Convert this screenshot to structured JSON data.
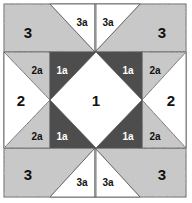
{
  "diagram": {
    "type": "quilt-block-piecing-diagram",
    "colors": {
      "background": "#ffffff",
      "print_fabric": "#c9c9c9",
      "dark_fabric": "#4d4d4d",
      "light_fabric": "#ffffff",
      "seam_line": "#555555"
    },
    "labels": {
      "center": "1",
      "dark_corner": "1a",
      "side": "2",
      "side_triangle": "2a",
      "corner": "3",
      "corner_triangle": "3a"
    },
    "pieces": {
      "center_square": {
        "label": "1",
        "fabric": "light"
      },
      "dark_triangles": [
        {
          "position": "top-left",
          "label": "1a"
        },
        {
          "position": "top-right",
          "label": "1a"
        },
        {
          "position": "bottom-left",
          "label": "1a"
        },
        {
          "position": "bottom-right",
          "label": "1a"
        }
      ],
      "side_units": [
        {
          "position": "left",
          "label": "2"
        },
        {
          "position": "right",
          "label": "2"
        }
      ],
      "side_triangles": [
        {
          "position": "left-top",
          "label": "2a"
        },
        {
          "position": "left-bottom",
          "label": "2a"
        },
        {
          "position": "right-top",
          "label": "2a"
        },
        {
          "position": "right-bottom",
          "label": "2a"
        }
      ],
      "corner_units": [
        {
          "position": "top-left",
          "label": "3"
        },
        {
          "position": "top-right",
          "label": "3"
        },
        {
          "position": "bottom-left",
          "label": "3"
        },
        {
          "position": "bottom-right",
          "label": "3"
        }
      ],
      "corner_triangles": [
        {
          "position": "top-left",
          "label": "3a"
        },
        {
          "position": "top-right",
          "label": "3a"
        },
        {
          "position": "bottom-left",
          "label": "3a"
        },
        {
          "position": "bottom-right",
          "label": "3a"
        }
      ]
    }
  }
}
